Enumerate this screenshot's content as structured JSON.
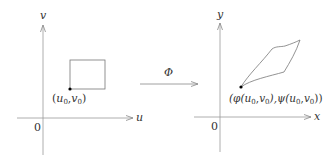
{
  "left_plot": {
    "v_axis_label": "v",
    "u_axis_label": "u",
    "origin_label": "0",
    "point_label": {
      "open": "(",
      "a": "u",
      "a_sub": "0",
      "sep": ",",
      "b": "v",
      "b_sub": "0",
      "close": ")"
    }
  },
  "mapping": {
    "label": "Φ"
  },
  "right_plot": {
    "y_axis_label": "y",
    "x_axis_label": "x",
    "origin_label": "0",
    "point_label": {
      "p1": "(φ(",
      "a": "u",
      "a_sub": "0",
      "sep1": ",",
      "b": "v",
      "b_sub": "0",
      "mid": "),ψ(",
      "c": "u",
      "c_sub": "0",
      "sep2": ",",
      "d": "v",
      "d_sub": "0",
      "end": "))"
    }
  },
  "colors": {
    "axis": "#888888",
    "shape": "#666666",
    "point": "#000000",
    "text": "#333333"
  }
}
